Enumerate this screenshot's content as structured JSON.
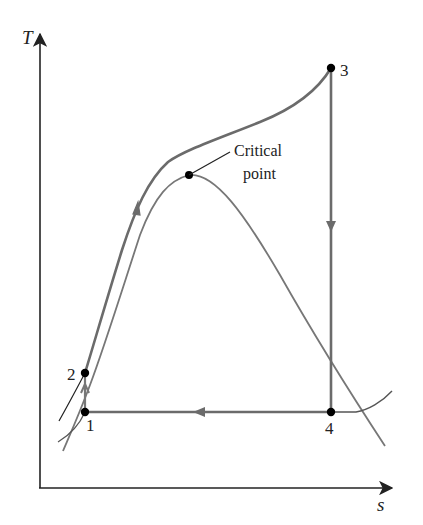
{
  "diagram": {
    "type": "T-s diagram",
    "axes": {
      "x_label": "s",
      "y_label": "T"
    },
    "states": [
      {
        "id": "1",
        "label": "1"
      },
      {
        "id": "2",
        "label": "2"
      },
      {
        "id": "3",
        "label": "3"
      },
      {
        "id": "4",
        "label": "4"
      }
    ],
    "critical_point": {
      "label_line1": "Critical",
      "label_line2": "point"
    },
    "processes": [
      {
        "from": "1",
        "to": "2",
        "direction": "up"
      },
      {
        "from": "2",
        "to": "3",
        "direction": "up-right"
      },
      {
        "from": "3",
        "to": "4",
        "direction": "down"
      },
      {
        "from": "4",
        "to": "1",
        "direction": "left"
      }
    ],
    "colors": {
      "axis": "#222222",
      "cycle": "#6b6b6b",
      "dome": "#707070",
      "point": "#000000"
    }
  }
}
